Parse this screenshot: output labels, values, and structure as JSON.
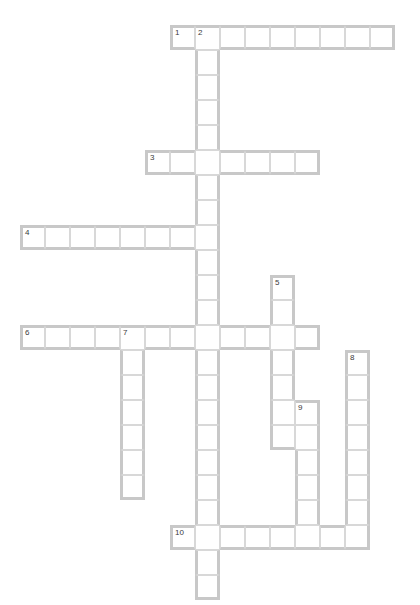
{
  "puzzle": {
    "title": "Crossword Puzzle Grid",
    "cell_size": 25,
    "origin_x": 20,
    "origin_y": 25,
    "grid_cols": 16,
    "grid_rows": 23,
    "colors": {
      "cell_fill": "#ffffff",
      "cell_inner_line": "#d8d8d8",
      "word_outline": "#c8c8c8",
      "number_text": "#3a3a3a",
      "page_background": "#ffffff"
    },
    "entries": [
      {
        "number": "1",
        "direction": "across",
        "col": 6,
        "row": 0,
        "length": 9
      },
      {
        "number": "2",
        "direction": "down",
        "col": 7,
        "row": 0,
        "length": 23
      },
      {
        "number": "3",
        "direction": "across",
        "col": 5,
        "row": 5,
        "length": 7
      },
      {
        "number": "4",
        "direction": "across",
        "col": 0,
        "row": 8,
        "length": 8
      },
      {
        "number": "5",
        "direction": "down",
        "col": 10,
        "row": 10,
        "length": 7
      },
      {
        "number": "6",
        "direction": "across",
        "col": 0,
        "row": 12,
        "length": 12
      },
      {
        "number": "7",
        "direction": "down",
        "col": 4,
        "row": 12,
        "length": 7
      },
      {
        "number": "8",
        "direction": "down",
        "col": 13,
        "row": 13,
        "length": 8
      },
      {
        "number": "9",
        "direction": "down",
        "col": 11,
        "row": 15,
        "length": 6
      },
      {
        "number": "10",
        "direction": "across",
        "col": 6,
        "row": 20,
        "length": 8
      }
    ],
    "numbered_cells": [
      {
        "label": "1",
        "col": 6,
        "row": 0
      },
      {
        "label": "2",
        "col": 7,
        "row": 0
      },
      {
        "label": "3",
        "col": 5,
        "row": 5
      },
      {
        "label": "4",
        "col": 0,
        "row": 8
      },
      {
        "label": "5",
        "col": 10,
        "row": 10
      },
      {
        "label": "6",
        "col": 0,
        "row": 12
      },
      {
        "label": "7",
        "col": 4,
        "row": 12
      },
      {
        "label": "8",
        "col": 13,
        "row": 13
      },
      {
        "label": "9",
        "col": 11,
        "row": 15
      },
      {
        "label": "10",
        "col": 6,
        "row": 20
      }
    ],
    "letters": []
  }
}
